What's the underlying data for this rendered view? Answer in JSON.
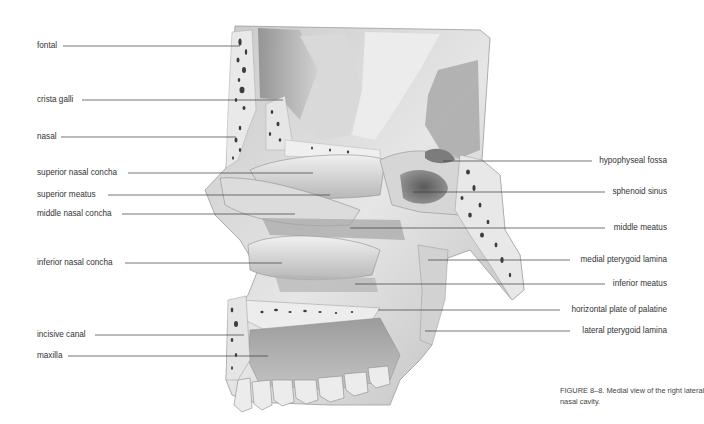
{
  "figure": {
    "number": "FIGURE 8–8.",
    "caption_line1": "FIGURE 8–8. Medial view of the right lateral wall of the",
    "caption_line2": "nasal cavity.",
    "subject": "Medial view of the right lateral wall of the nasal cavity"
  },
  "labels_left": [
    {
      "text": "fontal",
      "x": 37,
      "y": 46,
      "line_end_x": 240
    },
    {
      "text": "crista galli",
      "x": 37,
      "y": 100,
      "line_end_x": 283
    },
    {
      "text": "nasal",
      "x": 37,
      "y": 137,
      "line_end_x": 236
    },
    {
      "text": "superior nasal concha",
      "x": 37,
      "y": 173,
      "line_end_x": 313
    },
    {
      "text": "superior meatus",
      "x": 37,
      "y": 195,
      "line_end_x": 330
    },
    {
      "text": "middle nasal concha",
      "x": 37,
      "y": 214,
      "line_end_x": 295
    },
    {
      "text": "inferior nasal concha",
      "x": 37,
      "y": 263,
      "line_end_x": 282
    },
    {
      "text": "incisive canal",
      "x": 37,
      "y": 335,
      "line_end_x": 244
    },
    {
      "text": "maxilla",
      "x": 37,
      "y": 356,
      "line_end_x": 268
    }
  ],
  "labels_right": [
    {
      "text": "hypophyseal fossa",
      "right_x": 667,
      "y": 161,
      "line_start_x": 443
    },
    {
      "text": "sphenoid sinus",
      "right_x": 667,
      "y": 192,
      "line_start_x": 413
    },
    {
      "text": "middle meatus",
      "right_x": 667,
      "y": 228,
      "line_start_x": 350
    },
    {
      "text": "medial pterygoid lamina",
      "right_x": 667,
      "y": 260,
      "line_start_x": 428
    },
    {
      "text": "inferior meatus",
      "right_x": 667,
      "y": 284,
      "line_start_x": 355
    },
    {
      "text": "horizontal plate of palatine",
      "right_x": 667,
      "y": 310,
      "line_start_x": 378
    },
    {
      "text": "lateral pterygoid lamina",
      "right_x": 667,
      "y": 331,
      "line_start_x": 425
    }
  ],
  "colors": {
    "background": "#ffffff",
    "leader_line": "#3a3a3a",
    "label_text": "#333333",
    "bone_light": "#e4e4e4",
    "bone_mid": "#bdbdbd",
    "bone_dark": "#6e6e6e",
    "cancellous_spots": "#3c3c3c"
  }
}
